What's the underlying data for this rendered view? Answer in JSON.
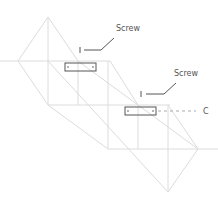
{
  "diagram": {
    "type": "stair-stringer-bracket-detail",
    "line_color": "#dcdcdc",
    "bracket_color": "#555555",
    "labels": {
      "screw_top": "Screw",
      "screw_bottom": "Screw",
      "dimension": "C"
    }
  }
}
